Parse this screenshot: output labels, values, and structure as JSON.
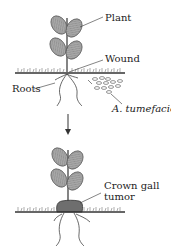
{
  "diagram": {
    "type": "biology-process",
    "stage1": {
      "labels": {
        "plant": "Plant",
        "wound": "Wound",
        "roots": "Roots",
        "bacteria": "A. tumefaciens"
      }
    },
    "arrow": {
      "direction": "down"
    },
    "stage2": {
      "labels": {
        "gall_line1": "Crown gall",
        "gall_line2": "tumor"
      }
    },
    "colors": {
      "leaf_fill": "#9a9a9a",
      "leaf_stroke": "#555555",
      "soil_line": "#333333",
      "grass": "#8a8a8a",
      "gall_fill": "#6e6e6e",
      "text": "#222222"
    }
  }
}
